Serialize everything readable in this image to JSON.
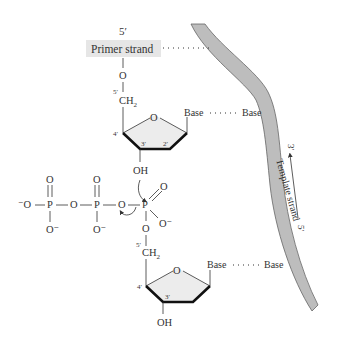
{
  "figure": {
    "primer": {
      "end_label": "5′",
      "label": "Primer strand",
      "label_bg": "#e6e6e6"
    },
    "template": {
      "label": "Template strand",
      "direction_top": "3′",
      "direction_bottom": "5′",
      "fill": "#bdbdbd"
    },
    "upper_nucleotide": {
      "five_prime": "5′",
      "ch2": "CH",
      "ch2_sub": "2",
      "ring_o": "O",
      "c4": "4′",
      "c3": "3′",
      "c2": "2′",
      "oh": "OH",
      "base": "Base",
      "pair_base": "Base",
      "o_link": "O"
    },
    "triphosphate": {
      "terminal_o_minus": "⁻O",
      "p1": "P",
      "p2": "P",
      "p3": "P",
      "bridge_o1": "O",
      "bridge_o2": "O",
      "bridge_o3": "O",
      "dbl_o1": "O",
      "dbl_o2": "O",
      "dbl_o3": "O",
      "o_minus1": "O⁻",
      "o_minus2": "O⁻",
      "o_minus3": "O⁻",
      "ester_o": "O"
    },
    "lower_nucleotide": {
      "five_prime": "5′",
      "ch2": "CH",
      "ch2_sub": "2",
      "ring_o": "O",
      "c4": "4′",
      "c3": "3′",
      "oh": "OH",
      "base": "Base",
      "pair_base": "Base"
    }
  }
}
